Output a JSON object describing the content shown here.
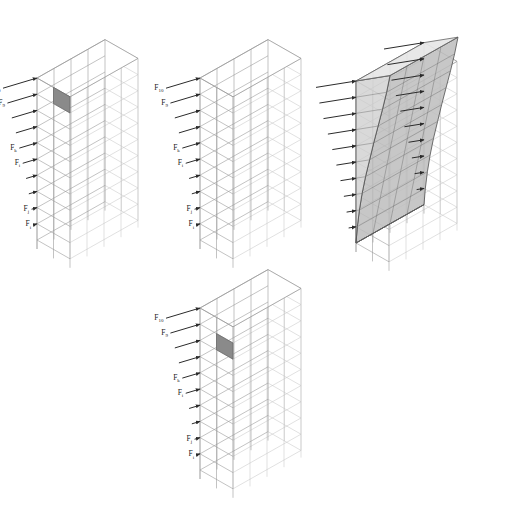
{
  "figure": {
    "background_color": "#ffffff",
    "canvas": {
      "width": 518,
      "height": 510
    },
    "panel_color": "#8a8a8a",
    "arrow_color": "#2b2b2b",
    "frame_color": "#9a9a9a",
    "deformation_fill": "#d2d2d2"
  },
  "panels": [
    {
      "id": "panel-a",
      "name": "frame-top-left",
      "position": "top-left",
      "storeys": 10,
      "bays_front": 2,
      "bays_side": 4,
      "has_force_arrows": true,
      "has_shaded_panel": true,
      "shaded_panel_storey": 10,
      "shaded_panel_note": "dark infill panel at top storey",
      "has_deformed_shape": false,
      "labels": [
        {
          "base": "F",
          "sub": "10",
          "storey": 10
        },
        {
          "base": "F",
          "sub": "9",
          "storey": 9
        },
        {
          "base": "F",
          "sub": "k",
          "storey": 6
        },
        {
          "base": "F",
          "sub": "i",
          "storey": 5
        },
        {
          "base": "F",
          "sub": "j",
          "storey": 2
        },
        {
          "base": "F",
          "sub": "i",
          "storey": 1
        }
      ]
    },
    {
      "id": "panel-b",
      "name": "frame-top-middle",
      "position": "top-middle",
      "storeys": 10,
      "bays_front": 2,
      "bays_side": 4,
      "has_force_arrows": true,
      "has_shaded_panel": false,
      "has_deformed_shape": false,
      "labels": [
        {
          "base": "F",
          "sub": "10",
          "storey": 10
        },
        {
          "base": "F",
          "sub": "9",
          "storey": 9
        },
        {
          "base": "F",
          "sub": "k",
          "storey": 6
        },
        {
          "base": "F",
          "sub": "i",
          "storey": 5
        },
        {
          "base": "F",
          "sub": "j",
          "storey": 2
        },
        {
          "base": "F",
          "sub": "i",
          "storey": 1
        }
      ]
    },
    {
      "id": "panel-c",
      "name": "frame-top-right",
      "position": "top-right",
      "storeys": 10,
      "bays_front": 2,
      "bays_side": 4,
      "has_force_arrows": true,
      "has_shaded_panel": false,
      "has_deformed_shape": true,
      "deformed_shape_note": "shaded curved lateral displacement profile over full height",
      "labels": []
    },
    {
      "id": "panel-d",
      "name": "frame-bottom-middle",
      "position": "bottom-middle",
      "storeys": 10,
      "bays_front": 2,
      "bays_side": 4,
      "has_force_arrows": true,
      "has_shaded_panel": true,
      "shaded_panel_storey": 9,
      "shaded_panel_note": "dark infill panel at ninth storey",
      "has_deformed_shape": false,
      "labels": [
        {
          "base": "F",
          "sub": "10",
          "storey": 10
        },
        {
          "base": "F",
          "sub": "9",
          "storey": 9
        },
        {
          "base": "F",
          "sub": "k",
          "storey": 6
        },
        {
          "base": "F",
          "sub": "i",
          "storey": 5
        },
        {
          "base": "F",
          "sub": "j",
          "storey": 2
        },
        {
          "base": "F",
          "sub": "i",
          "storey": 1
        }
      ]
    }
  ],
  "chart_data": {
    "type": "line",
    "xlabel": "Lateral force F",
    "ylabel": "Storey",
    "categories": [
      1,
      2,
      3,
      4,
      5,
      6,
      7,
      8,
      9,
      10
    ],
    "series": [
      {
        "name": "Relative force magnitude (arrow length, normalised)",
        "values": [
          0.1,
          0.16,
          0.24,
          0.32,
          0.42,
          0.52,
          0.62,
          0.74,
          0.87,
          1.0
        ]
      },
      {
        "name": "Relative lateral displacement (deformed profile, normalised)",
        "values": [
          0.04,
          0.1,
          0.18,
          0.28,
          0.4,
          0.52,
          0.65,
          0.78,
          0.9,
          1.0
        ]
      }
    ],
    "xlim": [
      0,
      1
    ],
    "ylim": [
      1,
      10
    ],
    "grid": false,
    "legend": "none"
  }
}
